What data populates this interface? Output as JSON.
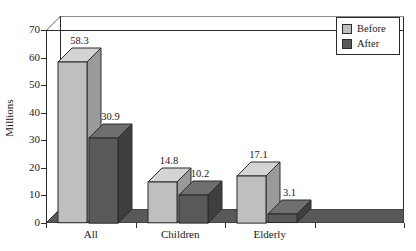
{
  "chart_data": {
    "type": "bar",
    "title": "",
    "xlabel": "",
    "ylabel": "Millions",
    "ylim": [
      0,
      70
    ],
    "yticks": [
      0,
      10,
      20,
      30,
      40,
      50,
      60,
      70
    ],
    "categories": [
      "All",
      "Children",
      "Elderly",
      ""
    ],
    "grid": true,
    "legend_position": "top-right",
    "style": "3d-grouped-bar",
    "series": [
      {
        "name": "Before",
        "color": "#bfbfbf",
        "values": [
          58.3,
          14.8,
          17.1,
          null
        ]
      },
      {
        "name": "After",
        "color": "#595959",
        "values": [
          30.9,
          10.2,
          3.1,
          null
        ]
      }
    ],
    "data_labels": [
      "58.3",
      "30.9",
      "14.8",
      "10.2",
      "17.1",
      "3.1"
    ],
    "colors": {
      "before_face": "#bfbfbf",
      "before_top": "#d4d4d4",
      "before_side": "#9a9a9a",
      "after_face": "#595959",
      "after_top": "#6f6f6f",
      "after_side": "#3f3f3f",
      "axis": "#2b2b2b",
      "gridline": "#8c8c8c",
      "background": "#ffffff"
    }
  },
  "legend": {
    "items": [
      {
        "label": "Before"
      },
      {
        "label": "After"
      }
    ]
  },
  "yaxis": {
    "title": "Millions",
    "ticks": [
      "70",
      "60",
      "50",
      "40",
      "30",
      "20",
      "10",
      "0"
    ]
  },
  "xaxis": {
    "labels": [
      "All",
      "Children",
      "Elderly"
    ]
  },
  "values": {
    "all_before": "58.3",
    "all_after": "30.9",
    "children_before": "14.8",
    "children_after": "10.2",
    "elderly_before": "17.1",
    "elderly_after": "3.1"
  }
}
